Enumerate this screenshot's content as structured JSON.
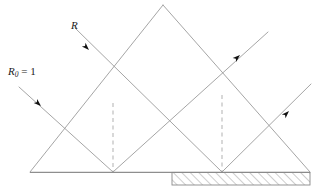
{
  "figure": {
    "background_color": "#ffffff",
    "line_color": "#9b9b9b",
    "dash_color": "#a8a8a8",
    "arrow_color": "#111111",
    "hatch_color": "#8a8a8a",
    "baseline_color": "#8e8e8e",
    "width": 316,
    "height": 193
  },
  "labels": {
    "incident_ray": {
      "name": "R",
      "text": "R",
      "subscript": ""
    },
    "initial_ray": {
      "name": "R0",
      "text": "R",
      "subscript": "0",
      "equals": " = 1"
    }
  },
  "geometry": {
    "baseline": {
      "y": 172,
      "x_start": 30,
      "x_end": 310
    },
    "apex": {
      "x": 163,
      "y": 5
    },
    "left_vertex": {
      "x": 30,
      "y": 172
    },
    "right_vertex": {
      "x": 310,
      "y": 172
    },
    "valley_left": {
      "x": 113,
      "y": 172
    },
    "valley_right": {
      "x": 222,
      "y": 172
    },
    "crossing_upper": {
      "x": 113,
      "y": 103
    },
    "crossing_lower": {
      "x": 170,
      "y": 125
    },
    "crossing_right": {
      "x": 222,
      "y": 95
    },
    "dashed_lines": [
      {
        "x": 113,
        "y_top": 103,
        "y_bottom": 172
      },
      {
        "x": 222,
        "y_top": 95,
        "y_bottom": 172
      }
    ],
    "substrate": {
      "x": 172,
      "y": 172,
      "width": 138,
      "height": 13
    }
  },
  "arrows": [
    {
      "name": "arrow-on-R",
      "x": 89,
      "y": 50,
      "angle_deg": 45
    },
    {
      "name": "arrow-on-R0",
      "x": 41,
      "y": 106,
      "angle_deg": 45
    },
    {
      "name": "arrow-out-upper-right",
      "x": 238,
      "y": 57,
      "angle_deg": -45
    },
    {
      "name": "arrow-out-lower-right",
      "x": 287,
      "y": 113,
      "angle_deg": -45
    }
  ]
}
